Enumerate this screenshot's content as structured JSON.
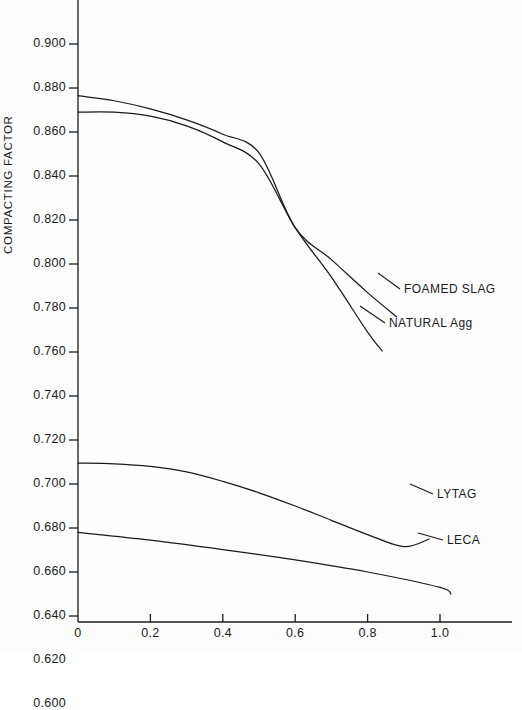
{
  "chart_data": {
    "type": "line",
    "title": "",
    "xlabel": "",
    "ylabel": "COMPACTING FACTOR",
    "xlim": [
      0,
      1.2
    ],
    "ylim": [
      0.6,
      0.91
    ],
    "grid": false,
    "legend_position": "inline-right-annotations",
    "x_ticks": [
      "0",
      "0.2",
      "0.4",
      "0.6",
      "0.8",
      "1.0"
    ],
    "x_tick_values": [
      0,
      0.2,
      0.4,
      0.6,
      0.8,
      1.0
    ],
    "y_ticks": [
      "0.900",
      "0.880",
      "0.860",
      "0.840",
      "0.820",
      "0.800",
      "0.780",
      "0.760",
      "0.740",
      "0.720",
      "0.700",
      "0.680",
      "0.660",
      "0.640",
      "0.620",
      "0.600"
    ],
    "y_tick_values": [
      0.9,
      0.88,
      0.86,
      0.84,
      0.82,
      0.8,
      0.78,
      0.76,
      0.74,
      0.72,
      0.7,
      0.68,
      0.66,
      0.64,
      0.62,
      0.6
    ],
    "series": [
      {
        "name": "FOAMED SLAG",
        "label": "FOAMED SLAG",
        "x": [
          0.0,
          0.1,
          0.2,
          0.3,
          0.4,
          0.5,
          0.6,
          0.7,
          0.8,
          0.88
        ],
        "values": [
          0.8765,
          0.8742,
          0.8705,
          0.8655,
          0.859,
          0.8505,
          0.8165,
          0.802,
          0.787,
          0.776
        ]
      },
      {
        "name": "NATURAL Agg",
        "label": "NATURAL Agg",
        "x": [
          0.0,
          0.1,
          0.2,
          0.3,
          0.4,
          0.5,
          0.6,
          0.7,
          0.8,
          0.84
        ],
        "values": [
          0.869,
          0.869,
          0.8672,
          0.8628,
          0.8555,
          0.8455,
          0.8165,
          0.794,
          0.769,
          0.7605
        ]
      },
      {
        "name": "LYTAG",
        "label": "LYTAG",
        "x": [
          0.0,
          0.1,
          0.2,
          0.3,
          0.4,
          0.5,
          0.6,
          0.7,
          0.8,
          0.9,
          0.97
        ],
        "values": [
          0.7095,
          0.7092,
          0.708,
          0.7055,
          0.7012,
          0.696,
          0.69,
          0.6835,
          0.677,
          0.6715,
          0.675
        ]
      },
      {
        "name": "LECA",
        "label": "LECA",
        "x": [
          0.0,
          0.2,
          0.4,
          0.6,
          0.8,
          1.0,
          1.03
        ],
        "values": [
          0.678,
          0.6745,
          0.6702,
          0.6655,
          0.66,
          0.653,
          0.65
        ]
      }
    ],
    "annotations": [
      {
        "text": "FOAMED SLAG",
        "series": "FOAMED SLAG"
      },
      {
        "text": "NATURAL Agg",
        "series": "NATURAL Agg"
      },
      {
        "text": "LYTAG",
        "series": "LYTAG"
      },
      {
        "text": "LECA",
        "series": "LECA"
      }
    ]
  },
  "axes": {
    "y_title": "COMPACTING FACTOR"
  },
  "series_labels": {
    "foamed_slag": "FOAMED SLAG",
    "natural_agg": "NATURAL Agg",
    "lytag": "LYTAG",
    "leca": "LECA"
  }
}
